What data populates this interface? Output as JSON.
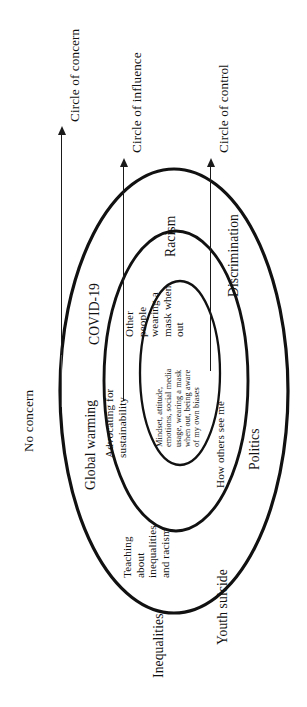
{
  "diagram": {
    "type": "concentric-circles-of-control",
    "orientation": "rotated-90-ccw",
    "axis_labels": {
      "concern": "Circle of concern",
      "influence": "Circle of influence",
      "control": "Circle of control",
      "no_concern": "No concern"
    },
    "rings": [
      {
        "id": "control",
        "name": "Circle of control",
        "items": [
          "Mindset, attitude,",
          "emotions, social media",
          "usage, wearing a mask",
          "when out, being aware",
          "of my own biases"
        ],
        "items_text": "Mindset, attitude, emotions, social media usage, wearing a mask when out, being aware of my own biases"
      },
      {
        "id": "influence",
        "name": "Circle of influence",
        "items": [
          "Advocating for sustainability",
          "Other people wearing a mask when out",
          "Teaching about inequalities and racism",
          "How others see me"
        ],
        "labels": {
          "advocating_l1": "Advocating for",
          "advocating_l2": "sustainability",
          "other_l1": "Other",
          "other_l2": "people",
          "other_l3": "wearing a",
          "other_l4": "mask when",
          "other_l5": "out",
          "teaching_l1": "Teaching",
          "teaching_l2": "about",
          "teaching_l3": "inequalities",
          "teaching_l4": "and racism",
          "how_others": "How others see me"
        }
      },
      {
        "id": "concern",
        "name": "Circle of concern",
        "items": [
          "Global warming",
          "COVID-19",
          "Racism",
          "Discrimination",
          "Politics",
          "Youth suicide",
          "Inequalities"
        ],
        "labels": {
          "global_warming": "Global warming",
          "covid": "COVID-19",
          "racism": "Racism",
          "discrimination": "Discrimination",
          "politics": "Politics",
          "youth_suicide": "Youth suicide",
          "inequalities": "Inequalities"
        }
      }
    ],
    "colors": {
      "stroke": "#111111",
      "background": "#ffffff",
      "arrow": "#1a1a1a",
      "text": "#111111"
    }
  }
}
